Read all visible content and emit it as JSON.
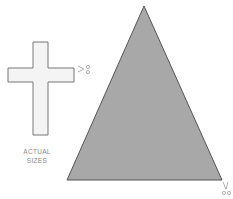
{
  "caption": {
    "line1": "ACTUAL",
    "line2": "SIZES"
  },
  "shapes": {
    "cross": {
      "fill": "#f4f4f4",
      "stroke": "#777777"
    },
    "triangle": {
      "fill": "#a8a8a8",
      "stroke": "#555555"
    }
  },
  "icons": [
    "scissors-icon",
    "scissors-icon"
  ]
}
